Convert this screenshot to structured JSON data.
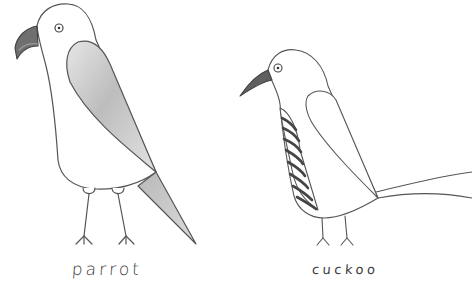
{
  "illustration": {
    "style": "hand-drawn pencil sketch on white paper",
    "background_color": "#ffffff",
    "line_color": "#555555",
    "birds": [
      {
        "name": "parrot",
        "label": "parrot",
        "features": [
          "hooked dark beak",
          "round eye",
          "grey shaded wing",
          "grey pointed tail",
          "two thin legs with three-toed feet"
        ],
        "wing_shade": "#c9c9c9",
        "beak_color": "#6a6a6a"
      },
      {
        "name": "cuckoo",
        "label": "cuckoo",
        "features": [
          "slim dark pointed beak",
          "round eye",
          "striped breast",
          "unshaded wing",
          "long thin tail",
          "two thin legs with three-toed feet"
        ],
        "stripe_color": "#4a4a4a",
        "beak_color": "#5a5a5a"
      }
    ]
  }
}
